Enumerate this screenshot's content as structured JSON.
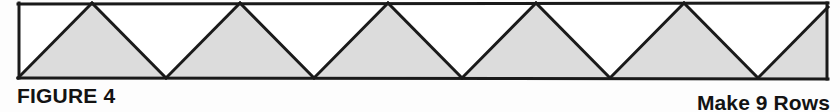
{
  "figure": {
    "label": "FIGURE 4",
    "instruction": "Make 9 Rows",
    "band": {
      "left": 18,
      "right": 828,
      "top": 3,
      "bottom": 78,
      "outline_color": "#1a1a1a",
      "outline_width": 3,
      "shaded_fill": "#dcdcdc",
      "white_fill": "#ffffff",
      "half_width": 74,
      "period": 148,
      "apex_positions": [
        92,
        240,
        388,
        536,
        684
      ],
      "valley_positions": [
        166,
        314,
        462,
        610,
        758
      ],
      "shaded_triangle_count": 6,
      "white_triangle_count": 5,
      "shape_sequence": [
        "shaded-up",
        "white-down",
        "shaded-up",
        "white-down",
        "shaded-up",
        "white-down",
        "shaded-up",
        "white-down",
        "shaded-up",
        "white-down",
        "shaded-up-half"
      ]
    }
  }
}
